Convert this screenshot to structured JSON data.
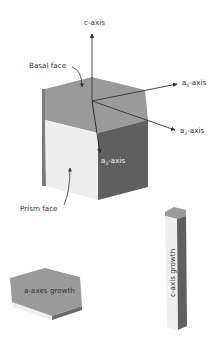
{
  "diagram": {
    "type": "hexagonal ice crystal axes diagram",
    "labels": {
      "c_axis": "c-axis",
      "basal_face": "Basal face",
      "a1_axis_prefix": "a",
      "a1_axis_sub": "1",
      "a1_axis_suffix": "-axis",
      "a2_axis_prefix": "a",
      "a2_axis_sub": "2",
      "a2_axis_suffix": "-axis",
      "a3_axis_prefix": "a",
      "a3_axis_sub": "3",
      "a3_axis_suffix": "-axis",
      "prism_face": "Prism face",
      "a_axes_growth": "a-axes growth",
      "c_axis_growth": "c-axis growth"
    },
    "colors": {
      "top_face": "#9a9a9a",
      "front_face": "#eeeeee",
      "side_face": "#5f5f5f",
      "left_edge": "#7c7c7c",
      "arrows": "#333333",
      "text": "#333333"
    }
  }
}
